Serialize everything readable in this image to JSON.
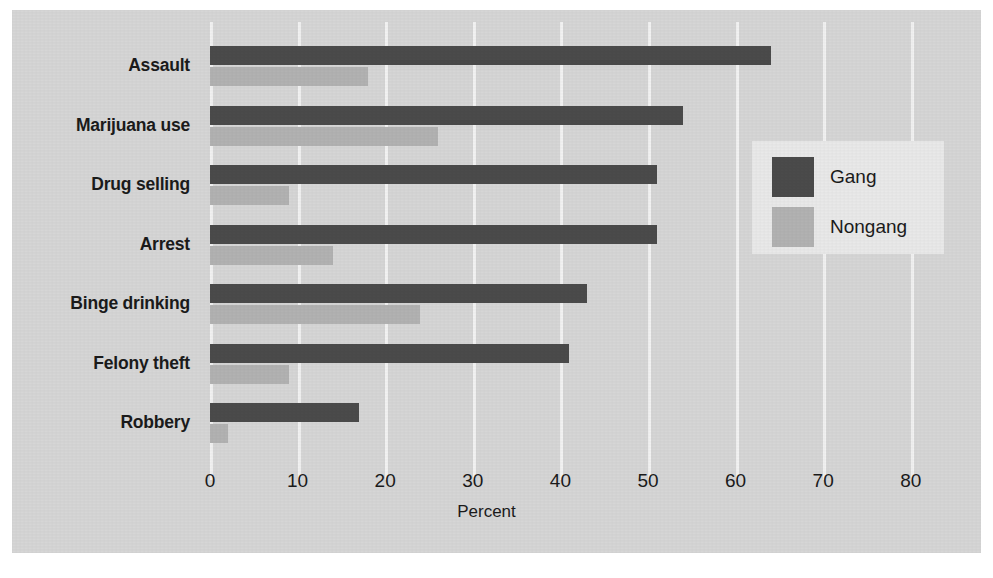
{
  "chart_data": {
    "type": "bar",
    "orientation": "horizontal",
    "title": "",
    "xlabel": "Percent",
    "ylabel": "",
    "xlim": [
      0,
      80
    ],
    "xticks": [
      0,
      10,
      20,
      30,
      40,
      50,
      60,
      70,
      80
    ],
    "xtick_labels": [
      "0",
      "10",
      "20",
      "30",
      "40",
      "50",
      "60",
      "70",
      "80"
    ],
    "grid": "vertical-only",
    "legend_position": "right-inside",
    "categories": [
      "Assault",
      "Marijuana use",
      "Drug selling",
      "Arrest",
      "Binge drinking",
      "Felony theft",
      "Robbery"
    ],
    "series": [
      {
        "name": "Gang",
        "color": "#4b4b4b",
        "values": [
          64,
          54,
          51,
          51,
          43,
          41,
          17
        ]
      },
      {
        "name": "Nongang",
        "color": "#b2b2b2",
        "values": [
          18,
          26,
          9,
          14,
          24,
          9,
          2
        ]
      }
    ]
  },
  "legend": {
    "entries": [
      {
        "label": "Gang",
        "color": "#4b4b4b"
      },
      {
        "label": "Nongang",
        "color": "#b2b2b2"
      }
    ]
  },
  "colors": {
    "panel_background": "#d6d6d6",
    "gridline": "#f2f2f2",
    "legend_background": "#e9e9e9",
    "text": "#1b1b1b",
    "gang": "#4b4b4b",
    "nongang": "#b2b2b2"
  }
}
